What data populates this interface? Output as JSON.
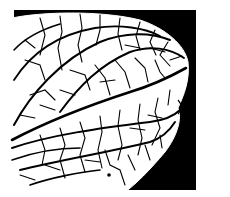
{
  "image": {
    "subject": "leaf venation illustration",
    "style": "black and white line art",
    "colors": {
      "background": "#ffffff",
      "frame": "#000000",
      "leaf": "#ffffff",
      "veins": "#000000"
    }
  }
}
